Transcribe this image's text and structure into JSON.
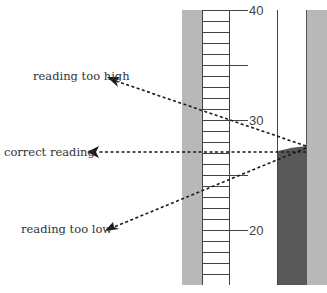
{
  "diagram": {
    "labels": {
      "too_high": "reading too high",
      "correct": "correct reading",
      "too_low": "reading too low"
    },
    "scale": {
      "major_ticks": [
        {
          "value": "40",
          "y": 10
        },
        {
          "value": "30",
          "y": 120
        },
        {
          "value": "20",
          "y": 230
        }
      ],
      "unit_px": 11,
      "top_value": 40,
      "bottom_value": 15
    },
    "liquid_level_value": 27.5,
    "colors": {
      "wall": "#b8b8b8",
      "liquid": "#595959",
      "line": "#333333",
      "arrow": "#1a1a1a"
    }
  }
}
